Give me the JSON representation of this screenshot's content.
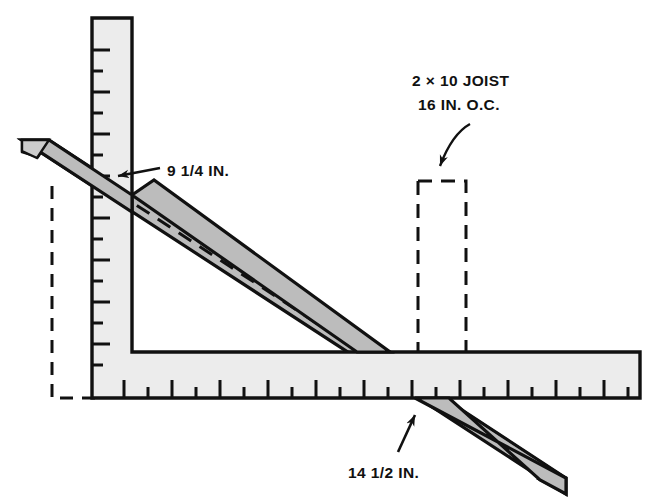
{
  "figure": {
    "kind": "technical-line-drawing",
    "background_color": "#ffffff"
  },
  "colors": {
    "outline": "#111111",
    "square_fill": "#ececec",
    "board_fill": "#b4b4b4",
    "board_fill_light": "#c8c8c8",
    "dashed": "#111111"
  },
  "labels": {
    "joist_line1": "2 × 10 JOIST",
    "joist_line2": "16 IN. O.C.",
    "rise": "9 1/4 IN.",
    "run": "14 1/2 IN."
  },
  "annotations": [
    {
      "name": "joist-callout",
      "text_lines": [
        "2 × 10 JOIST",
        "16 IN. O.C."
      ],
      "arrow": "curved-down-left",
      "points_to": "joist-outline"
    },
    {
      "name": "rise-callout",
      "text_lines": [
        "9 1/4 IN."
      ],
      "arrow": "straight-left",
      "points_to": "square-vertical-arm-intersection"
    },
    {
      "name": "run-callout",
      "text_lines": [
        "14 1/2 IN."
      ],
      "arrow": "straight-up",
      "points_to": "square-horizontal-arm-intersection"
    }
  ],
  "parts": [
    {
      "name": "framing-square",
      "description": "L-shaped carpenter square with graduated inch tick marks"
    },
    {
      "name": "diagonal-board",
      "description": "shaded stair stringer board crossing the square"
    },
    {
      "name": "joist-outline",
      "description": "dashed rectangle representing a 2 x 10 joist"
    },
    {
      "name": "left-dashed-outline",
      "description": "dashed reference outline at lower left"
    },
    {
      "name": "dashed-diagonal",
      "description": "dashed layout line parallel to the board"
    }
  ],
  "measurements": {
    "rise_in": "9 1/4",
    "run_in": "14 1/2",
    "joist_nominal": "2 x 10",
    "joist_spacing_in": "16"
  }
}
